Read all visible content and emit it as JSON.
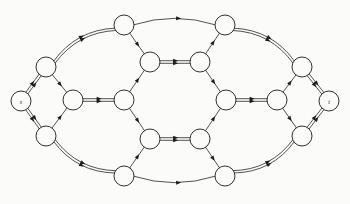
{
  "figure": {
    "caption": "",
    "background_color": "#fbfbf9",
    "stroke_color": "#1a1a1a",
    "node_fill": "#fbfbf9"
  },
  "graph": {
    "type": "directed-flow-network",
    "node_radius": 10,
    "nodes": [
      {
        "id": "s",
        "label": "s",
        "x": 21,
        "y": 101,
        "r": 10
      },
      {
        "id": "a1",
        "label": "",
        "x": 46,
        "y": 67,
        "r": 10
      },
      {
        "id": "a2",
        "label": "",
        "x": 46,
        "y": 136,
        "r": 10
      },
      {
        "id": "b",
        "label": "",
        "x": 73,
        "y": 100,
        "r": 10
      },
      {
        "id": "c1",
        "label": "",
        "x": 124,
        "y": 25,
        "r": 10
      },
      {
        "id": "c2",
        "label": "",
        "x": 124,
        "y": 176,
        "r": 10
      },
      {
        "id": "m",
        "label": "",
        "x": 124,
        "y": 100,
        "r": 10
      },
      {
        "id": "h1",
        "label": "",
        "x": 150,
        "y": 62,
        "r": 10
      },
      {
        "id": "h2",
        "label": "",
        "x": 200,
        "y": 62,
        "r": 10
      },
      {
        "id": "h3",
        "label": "",
        "x": 150,
        "y": 139,
        "r": 10
      },
      {
        "id": "h4",
        "label": "",
        "x": 200,
        "y": 139,
        "r": 10
      },
      {
        "id": "d1",
        "label": "",
        "x": 225,
        "y": 25,
        "r": 10
      },
      {
        "id": "d2",
        "label": "",
        "x": 225,
        "y": 176,
        "r": 10
      },
      {
        "id": "n",
        "label": "",
        "x": 226,
        "y": 100,
        "r": 10
      },
      {
        "id": "p",
        "label": "",
        "x": 277,
        "y": 100,
        "r": 10
      },
      {
        "id": "e1",
        "label": "",
        "x": 302,
        "y": 67,
        "r": 10
      },
      {
        "id": "e2",
        "label": "",
        "x": 302,
        "y": 136,
        "r": 10
      },
      {
        "id": "t",
        "label": "t",
        "x": 329,
        "y": 101,
        "r": 10
      }
    ],
    "edges": [
      {
        "from": "s",
        "to": "a1",
        "parallel": 2,
        "style": "straight"
      },
      {
        "from": "s",
        "to": "a2",
        "parallel": 2,
        "style": "straight"
      },
      {
        "from": "a1",
        "to": "b",
        "parallel": 1,
        "style": "straight"
      },
      {
        "from": "a2",
        "to": "b",
        "parallel": 1,
        "style": "straight"
      },
      {
        "from": "a1",
        "to": "c1",
        "parallel": 2,
        "style": "curve-up"
      },
      {
        "from": "a2",
        "to": "c2",
        "parallel": 2,
        "style": "curve-down"
      },
      {
        "from": "b",
        "to": "m",
        "parallel": 2,
        "style": "straight"
      },
      {
        "from": "m",
        "to": "h1",
        "parallel": 1,
        "style": "straight"
      },
      {
        "from": "m",
        "to": "h3",
        "parallel": 1,
        "style": "straight"
      },
      {
        "from": "c1",
        "to": "h1",
        "parallel": 1,
        "style": "straight"
      },
      {
        "from": "c2",
        "to": "h3",
        "parallel": 1,
        "style": "straight"
      },
      {
        "from": "h1",
        "to": "h2",
        "parallel": 2,
        "style": "straight"
      },
      {
        "from": "h3",
        "to": "h4",
        "parallel": 2,
        "style": "straight"
      },
      {
        "from": "c1",
        "to": "d1",
        "parallel": 1,
        "style": "curve-up-flat"
      },
      {
        "from": "c2",
        "to": "d2",
        "parallel": 1,
        "style": "curve-down-flat"
      },
      {
        "from": "h2",
        "to": "d1",
        "parallel": 1,
        "style": "straight"
      },
      {
        "from": "h4",
        "to": "d2",
        "parallel": 1,
        "style": "straight"
      },
      {
        "from": "h2",
        "to": "n",
        "parallel": 1,
        "style": "straight"
      },
      {
        "from": "h4",
        "to": "n",
        "parallel": 1,
        "style": "straight"
      },
      {
        "from": "n",
        "to": "p",
        "parallel": 2,
        "style": "straight"
      },
      {
        "from": "d1",
        "to": "e1",
        "parallel": 2,
        "style": "curve-up"
      },
      {
        "from": "d2",
        "to": "e2",
        "parallel": 2,
        "style": "curve-down"
      },
      {
        "from": "p",
        "to": "e1",
        "parallel": 1,
        "style": "straight"
      },
      {
        "from": "p",
        "to": "e2",
        "parallel": 1,
        "style": "straight"
      },
      {
        "from": "e1",
        "to": "t",
        "parallel": 2,
        "style": "straight"
      },
      {
        "from": "e2",
        "to": "t",
        "parallel": 2,
        "style": "straight"
      }
    ]
  }
}
